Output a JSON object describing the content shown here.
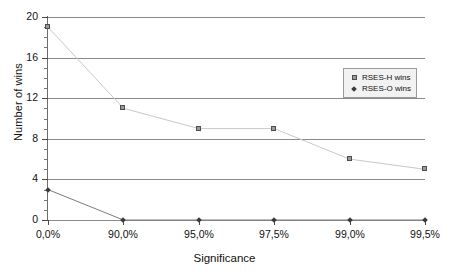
{
  "chart_data": {
    "type": "line",
    "title": "",
    "xlabel": "Significance",
    "ylabel": "Number of wins",
    "categories": [
      "0,0%",
      "90,0%",
      "95,0%",
      "97,5%",
      "99,0%",
      "99,5%"
    ],
    "series": [
      {
        "name": "RSES-H wins",
        "marker": "square",
        "color": "#9a9a9a",
        "values": [
          19,
          11,
          9,
          9,
          6,
          5
        ]
      },
      {
        "name": "RSES-O wins",
        "marker": "diamond",
        "color": "#3a3a3a",
        "values": [
          3,
          0,
          0,
          0,
          0,
          0
        ]
      }
    ],
    "ylim": [
      0,
      20
    ],
    "ytick_labels": [
      "0",
      "4",
      "8",
      "12",
      "16",
      "20"
    ],
    "ytick_values": [
      0,
      4,
      8,
      12,
      16,
      20
    ],
    "yminor_step": 1,
    "grid": "horizontal",
    "legend_position": "upper-right-inside"
  },
  "legend": {
    "items": [
      {
        "label": "RSES-H wins",
        "icon": "square-marker-icon"
      },
      {
        "label": "RSES-O wins",
        "icon": "diamond-marker-icon"
      }
    ]
  }
}
